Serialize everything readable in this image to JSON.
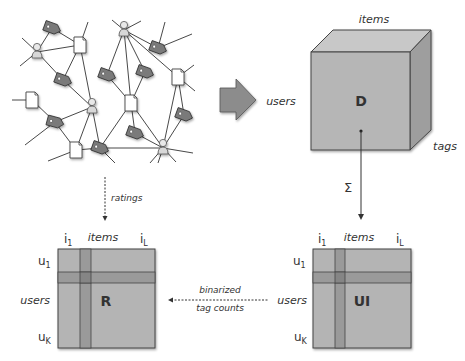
{
  "cube": {
    "label": "D",
    "axis_top": "items",
    "axis_left": "users",
    "axis_right": "tags"
  },
  "sum_symbol": "Σ",
  "ratings_label": "ratings",
  "binarized_label_1": "binarized",
  "binarized_label_2": "tag counts",
  "matrix_r": {
    "label": "R",
    "col_first": "i",
    "col_first_sub": "1",
    "col_label": "items",
    "col_last": "i",
    "col_last_sub": "L",
    "row_first": "u",
    "row_first_sub": "1",
    "row_label": "users",
    "row_last": "u",
    "row_last_sub": "K"
  },
  "matrix_ui": {
    "label": "UI",
    "col_first": "i",
    "col_first_sub": "1",
    "col_label": "items",
    "col_last": "i",
    "col_last_sub": "L",
    "row_first": "u",
    "row_first_sub": "1",
    "row_label": "users",
    "row_last": "u",
    "row_last_sub": "K"
  },
  "colors": {
    "matrix_fill": "#b4b4b4",
    "matrix_band": "#9a9a9a",
    "matrix_cross": "#858585",
    "cube_front": "#b6b6b6",
    "cube_top": "#c8c8c8",
    "cube_side": "#9e9e9e",
    "tag_fill": "#7a7a7a",
    "arrow_fill": "#8c8c8c"
  }
}
